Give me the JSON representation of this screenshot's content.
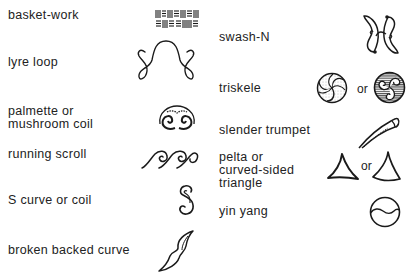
{
  "figure": {
    "left_column": [
      {
        "id": "basket-work",
        "label": [
          "basket-work"
        ]
      },
      {
        "id": "lyre-loop",
        "label": [
          "lyre loop"
        ]
      },
      {
        "id": "palmette",
        "label": [
          "palmette or",
          "mushroom coil"
        ]
      },
      {
        "id": "running-scroll",
        "label": [
          "running scroll"
        ]
      },
      {
        "id": "s-curve",
        "label": [
          "S curve or coil"
        ]
      },
      {
        "id": "broken-backed-curve",
        "label": [
          "broken backed curve"
        ]
      }
    ],
    "right_column": [
      {
        "id": "swash-n",
        "label": [
          "swash-N"
        ]
      },
      {
        "id": "triskele",
        "label": [
          "triskele"
        ],
        "connector": "or"
      },
      {
        "id": "slender-trumpet",
        "label": [
          "slender trumpet"
        ]
      },
      {
        "id": "pelta",
        "label": [
          "pelta or",
          "curved-sided",
          "triangle"
        ],
        "connector": "or"
      },
      {
        "id": "yin-yang",
        "label": [
          "yin yang"
        ]
      }
    ]
  },
  "colors": {
    "ink": "#1a1a1a",
    "background": "#ffffff",
    "stipple": "#777777"
  }
}
